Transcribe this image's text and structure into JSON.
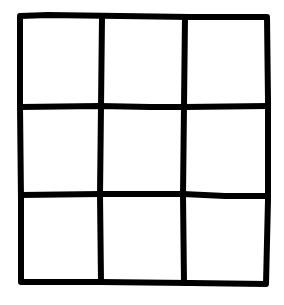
{
  "diagram": {
    "type": "grid",
    "rows": 3,
    "columns": 3,
    "cells": [
      [
        "",
        "",
        ""
      ],
      [
        "",
        "",
        ""
      ],
      [
        "",
        "",
        ""
      ]
    ],
    "stroke_color": "#000000",
    "background_color": "#ffffff",
    "style": "hand-drawn"
  }
}
